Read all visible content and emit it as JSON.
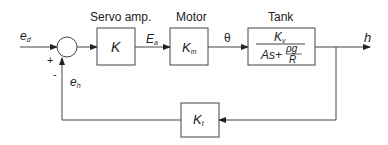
{
  "diagram": {
    "type": "closed-loop block diagram",
    "input": {
      "symbol": "e",
      "subscript": "d"
    },
    "summing_junction": {
      "plus_sign": "+",
      "minus_sign": "-"
    },
    "feedback_signal": {
      "symbol": "e",
      "subscript": "h"
    },
    "blocks": [
      {
        "title": "Servo amp.",
        "gain": "K",
        "subscript": ""
      },
      {
        "title": "Motor",
        "gain": "K",
        "subscript": "m"
      },
      {
        "title": "Tank",
        "numerator": "K",
        "numerator_sub": "v",
        "denominator_prefix": "As+",
        "denominator_frac_num": "ρg",
        "denominator_frac_den": "R"
      }
    ],
    "signals": [
      {
        "symbol": "E",
        "subscript": "a"
      },
      {
        "symbol": "θ"
      }
    ],
    "output": {
      "symbol": "h"
    },
    "feedback_block": {
      "gain": "K",
      "subscript": "t"
    }
  }
}
